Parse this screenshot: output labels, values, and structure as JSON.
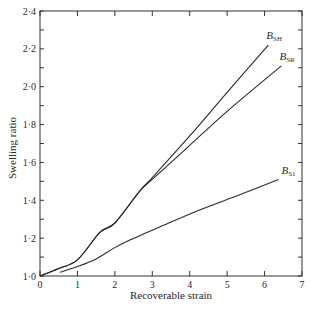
{
  "chart_data": {
    "type": "line",
    "title": "",
    "xlabel": "Recoverable strain",
    "ylabel": "Swelling ratio",
    "xlim": [
      0,
      7
    ],
    "ylim": [
      1.0,
      2.4
    ],
    "xticks": [
      "0",
      "1",
      "2",
      "3",
      "4",
      "5",
      "6",
      "7"
    ],
    "yticks": [
      "1·0",
      "1·2",
      "1·4",
      "1·6",
      "1·8",
      "2·0",
      "2·2",
      "2·4"
    ],
    "grid": false,
    "legend": "inline labels at curve ends",
    "series": [
      {
        "name": "B_SH",
        "label_main": "B",
        "label_sub": "SH",
        "x": [
          0,
          0.5,
          1.0,
          1.6,
          2.0,
          2.67,
          3.0,
          4.0,
          5.0,
          6.1
        ],
        "y": [
          1.0,
          1.04,
          1.085,
          1.23,
          1.28,
          1.45,
          1.52,
          1.74,
          1.97,
          2.22
        ]
      },
      {
        "name": "B_SR",
        "label_main": "B",
        "label_sub": "SR",
        "x": [
          0,
          0.5,
          1.0,
          1.6,
          2.0,
          2.67,
          3.0,
          4.0,
          5.0,
          6.45
        ],
        "y": [
          1.0,
          1.04,
          1.085,
          1.23,
          1.28,
          1.45,
          1.51,
          1.69,
          1.87,
          2.11
        ]
      },
      {
        "name": "B_S1",
        "label_main": "B",
        "label_sub": "S1",
        "x": [
          0.53,
          1.0,
          1.5,
          2.0,
          2.4,
          3.21,
          4.28,
          5.35,
          6.37
        ],
        "y": [
          1.02,
          1.05,
          1.09,
          1.15,
          1.19,
          1.26,
          1.35,
          1.43,
          1.51
        ]
      }
    ]
  }
}
